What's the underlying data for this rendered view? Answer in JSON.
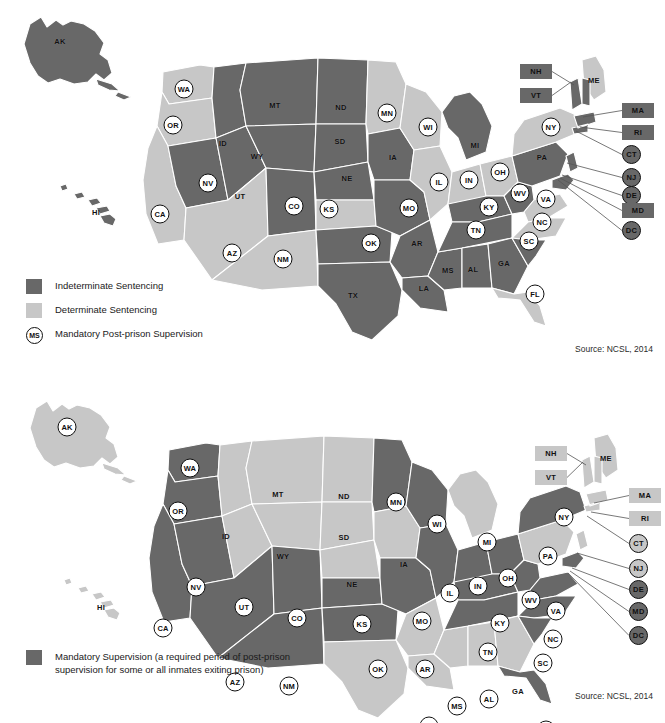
{
  "colors": {
    "dark": "#686868",
    "light": "#c7c7c7",
    "outline": "#ffffff",
    "text": "#101010",
    "background": "#ffffff"
  },
  "maps": [
    {
      "id": "sentencing-map",
      "title": "State Sentencing Structures",
      "source": "Source: NCSL, 2014",
      "legend": [
        {
          "type": "swatch",
          "shade": "dark",
          "label": "Indeterminate Sentencing"
        },
        {
          "type": "swatch",
          "shade": "light",
          "label": "Determinate Sentencing"
        },
        {
          "type": "circle",
          "glyph": "MS",
          "label": "Mandatory Post-prison Supervision"
        }
      ],
      "states": [
        {
          "abbr": "AK",
          "shade": "dark",
          "circled": false,
          "x": 60,
          "y": 41
        },
        {
          "abbr": "HI",
          "shade": "dark",
          "circled": false,
          "x": 96,
          "y": 212
        },
        {
          "abbr": "WA",
          "shade": "light",
          "circled": true,
          "x": 184,
          "y": 89
        },
        {
          "abbr": "OR",
          "shade": "light",
          "circled": true,
          "x": 173,
          "y": 125
        },
        {
          "abbr": "CA",
          "shade": "light",
          "circled": true,
          "x": 160,
          "y": 214
        },
        {
          "abbr": "NV",
          "shade": "dark",
          "circled": true,
          "x": 208,
          "y": 183
        },
        {
          "abbr": "ID",
          "shade": "dark",
          "circled": false,
          "x": 223,
          "y": 143
        },
        {
          "abbr": "UT",
          "shade": "dark",
          "circled": false,
          "x": 240,
          "y": 196
        },
        {
          "abbr": "AZ",
          "shade": "light",
          "circled": true,
          "x": 232,
          "y": 253
        },
        {
          "abbr": "MT",
          "shade": "dark",
          "circled": false,
          "x": 275,
          "y": 105
        },
        {
          "abbr": "WY",
          "shade": "dark",
          "circled": false,
          "x": 257,
          "y": 156
        },
        {
          "abbr": "CO",
          "shade": "dark",
          "circled": true,
          "x": 294,
          "y": 206
        },
        {
          "abbr": "NM",
          "shade": "light",
          "circled": true,
          "x": 283,
          "y": 259
        },
        {
          "abbr": "ND",
          "shade": "dark",
          "circled": false,
          "x": 341,
          "y": 107
        },
        {
          "abbr": "SD",
          "shade": "dark",
          "circled": false,
          "x": 340,
          "y": 141
        },
        {
          "abbr": "NE",
          "shade": "dark",
          "circled": false,
          "x": 347,
          "y": 178
        },
        {
          "abbr": "KS",
          "shade": "light",
          "circled": true,
          "x": 329,
          "y": 209
        },
        {
          "abbr": "OK",
          "shade": "dark",
          "circled": true,
          "x": 371,
          "y": 243
        },
        {
          "abbr": "TX",
          "shade": "dark",
          "circled": false,
          "x": 353,
          "y": 295
        },
        {
          "abbr": "MN",
          "shade": "light",
          "circled": true,
          "x": 387,
          "y": 113
        },
        {
          "abbr": "IA",
          "shade": "dark",
          "circled": false,
          "x": 393,
          "y": 157
        },
        {
          "abbr": "MO",
          "shade": "dark",
          "circled": true,
          "x": 409,
          "y": 208
        },
        {
          "abbr": "AR",
          "shade": "dark",
          "circled": false,
          "x": 417,
          "y": 243
        },
        {
          "abbr": "LA",
          "shade": "dark",
          "circled": false,
          "x": 424,
          "y": 288
        },
        {
          "abbr": "WI",
          "shade": "light",
          "circled": true,
          "x": 428,
          "y": 127
        },
        {
          "abbr": "IL",
          "shade": "light",
          "circled": true,
          "x": 439,
          "y": 182
        },
        {
          "abbr": "IN",
          "shade": "light",
          "circled": true,
          "x": 469,
          "y": 180
        },
        {
          "abbr": "MS",
          "shade": "dark",
          "circled": false,
          "x": 448,
          "y": 270
        },
        {
          "abbr": "MI",
          "shade": "dark",
          "circled": false,
          "x": 475,
          "y": 145
        },
        {
          "abbr": "OH",
          "shade": "light",
          "circled": true,
          "x": 500,
          "y": 172
        },
        {
          "abbr": "KY",
          "shade": "dark",
          "circled": true,
          "x": 489,
          "y": 207
        },
        {
          "abbr": "TN",
          "shade": "dark",
          "circled": true,
          "x": 476,
          "y": 230
        },
        {
          "abbr": "AL",
          "shade": "dark",
          "circled": false,
          "x": 473,
          "y": 269
        },
        {
          "abbr": "GA",
          "shade": "dark",
          "circled": false,
          "x": 504,
          "y": 263
        },
        {
          "abbr": "WV",
          "shade": "dark",
          "circled": true,
          "x": 520,
          "y": 193
        },
        {
          "abbr": "PA",
          "shade": "dark",
          "circled": false,
          "x": 542,
          "y": 157
        },
        {
          "abbr": "NY",
          "shade": "light",
          "circled": true,
          "x": 551,
          "y": 127
        },
        {
          "abbr": "ME",
          "shade": "light",
          "circled": false,
          "x": 594,
          "y": 80
        },
        {
          "abbr": "VA",
          "shade": "light",
          "circled": true,
          "x": 546,
          "y": 199
        },
        {
          "abbr": "NC",
          "shade": "light",
          "circled": true,
          "x": 542,
          "y": 222
        },
        {
          "abbr": "SC",
          "shade": "dark",
          "circled": true,
          "x": 529,
          "y": 241
        },
        {
          "abbr": "FL",
          "shade": "light",
          "circled": true,
          "x": 535,
          "y": 294
        }
      ],
      "callouts": [
        {
          "abbr": "NH",
          "kind": "box",
          "shade": "dark",
          "x": 520,
          "y": 64,
          "tx": 574,
          "ty": 85
        },
        {
          "abbr": "VT",
          "kind": "box",
          "shade": "dark",
          "x": 520,
          "y": 88,
          "tx": 571,
          "ty": 82
        },
        {
          "abbr": "MA",
          "kind": "box",
          "shade": "dark",
          "x": 622,
          "y": 103,
          "tx": 583,
          "ty": 117
        },
        {
          "abbr": "RI",
          "kind": "box",
          "shade": "dark",
          "x": 622,
          "y": 125,
          "tx": 580,
          "ty": 127
        },
        {
          "abbr": "CT",
          "kind": "circle",
          "shade": "dark",
          "x": 622,
          "y": 145,
          "tx": 576,
          "ty": 131
        },
        {
          "abbr": "NJ",
          "kind": "circle",
          "shade": "dark",
          "x": 622,
          "y": 168,
          "tx": 567,
          "ty": 163
        },
        {
          "abbr": "DE",
          "kind": "circle",
          "shade": "dark",
          "x": 622,
          "y": 186,
          "tx": 562,
          "ty": 175
        },
        {
          "abbr": "MD",
          "kind": "box",
          "shade": "dark",
          "x": 622,
          "y": 203,
          "tx": 560,
          "ty": 178
        },
        {
          "abbr": "DC",
          "kind": "circle",
          "shade": "dark",
          "x": 622,
          "y": 221,
          "tx": 558,
          "ty": 180
        }
      ]
    },
    {
      "id": "mandatory-supervision-map",
      "title": "Mandatory Post-prison Supervision",
      "source": "Source: NCSL, 2014",
      "legend": [
        {
          "type": "swatch",
          "shade": "dark",
          "label": "Mandatory Supervision (a required period of post-prison supervision for some or all inmates exiting prison)"
        }
      ],
      "states": [
        {
          "abbr": "AK",
          "shade": "light",
          "circled": true,
          "x": 67,
          "y": 65
        },
        {
          "abbr": "HI",
          "shade": "light",
          "circled": false,
          "x": 101,
          "y": 245
        },
        {
          "abbr": "WA",
          "shade": "dark",
          "circled": true,
          "x": 190,
          "y": 106
        },
        {
          "abbr": "OR",
          "shade": "dark",
          "circled": true,
          "x": 178,
          "y": 149
        },
        {
          "abbr": "CA",
          "shade": "dark",
          "circled": true,
          "x": 163,
          "y": 266
        },
        {
          "abbr": "NV",
          "shade": "dark",
          "circled": true,
          "x": 196,
          "y": 225
        },
        {
          "abbr": "ID",
          "shade": "light",
          "circled": false,
          "x": 226,
          "y": 174
        },
        {
          "abbr": "UT",
          "shade": "light",
          "circled": true,
          "x": 244,
          "y": 245
        },
        {
          "abbr": "AZ",
          "shade": "dark",
          "circled": true,
          "x": 235,
          "y": 320
        },
        {
          "abbr": "MT",
          "shade": "light",
          "circled": false,
          "x": 278,
          "y": 132
        },
        {
          "abbr": "WY",
          "shade": "light",
          "circled": false,
          "x": 283,
          "y": 194
        },
        {
          "abbr": "CO",
          "shade": "dark",
          "circled": true,
          "x": 297,
          "y": 256
        },
        {
          "abbr": "NM",
          "shade": "dark",
          "circled": true,
          "x": 289,
          "y": 324
        },
        {
          "abbr": "ND",
          "shade": "light",
          "circled": false,
          "x": 344,
          "y": 134
        },
        {
          "abbr": "SD",
          "shade": "light",
          "circled": false,
          "x": 344,
          "y": 175
        },
        {
          "abbr": "NE",
          "shade": "light",
          "circled": false,
          "x": 352,
          "y": 222
        },
        {
          "abbr": "KS",
          "shade": "dark",
          "circled": true,
          "x": 362,
          "y": 262
        },
        {
          "abbr": "OK",
          "shade": "dark",
          "circled": true,
          "x": 378,
          "y": 307
        },
        {
          "abbr": "TX",
          "shade": "light",
          "circled": false,
          "x": 361,
          "y": 368
        },
        {
          "abbr": "MN",
          "shade": "dark",
          "circled": true,
          "x": 396,
          "y": 140
        },
        {
          "abbr": "IA",
          "shade": "light",
          "circled": false,
          "x": 404,
          "y": 202
        },
        {
          "abbr": "MO",
          "shade": "dark",
          "circled": true,
          "x": 422,
          "y": 259
        },
        {
          "abbr": "AR",
          "shade": "light",
          "circled": true,
          "x": 425,
          "y": 307
        },
        {
          "abbr": "LA",
          "shade": "light",
          "circled": true,
          "x": 429,
          "y": 364
        },
        {
          "abbr": "WI",
          "shade": "dark",
          "circled": true,
          "x": 437,
          "y": 162
        },
        {
          "abbr": "IL",
          "shade": "dark",
          "circled": true,
          "x": 450,
          "y": 231
        },
        {
          "abbr": "IN",
          "shade": "dark",
          "circled": true,
          "x": 478,
          "y": 224
        },
        {
          "abbr": "MS",
          "shade": "light",
          "circled": true,
          "x": 457,
          "y": 344
        },
        {
          "abbr": "MI",
          "shade": "light",
          "circled": true,
          "x": 487,
          "y": 180
        },
        {
          "abbr": "OH",
          "shade": "dark",
          "circled": true,
          "x": 508,
          "y": 216
        },
        {
          "abbr": "KY",
          "shade": "dark",
          "circled": true,
          "x": 500,
          "y": 261
        },
        {
          "abbr": "TN",
          "shade": "dark",
          "circled": true,
          "x": 488,
          "y": 290
        },
        {
          "abbr": "AL",
          "shade": "light",
          "circled": true,
          "x": 489,
          "y": 337
        },
        {
          "abbr": "GA",
          "shade": "light",
          "circled": false,
          "x": 518,
          "y": 329
        },
        {
          "abbr": "WV",
          "shade": "dark",
          "circled": true,
          "x": 531,
          "y": 238
        },
        {
          "abbr": "PA",
          "shade": "light",
          "circled": true,
          "x": 548,
          "y": 194
        },
        {
          "abbr": "NY",
          "shade": "dark",
          "circled": true,
          "x": 564,
          "y": 155
        },
        {
          "abbr": "ME",
          "shade": "light",
          "circled": false,
          "x": 606,
          "y": 96
        },
        {
          "abbr": "VA",
          "shade": "dark",
          "circled": true,
          "x": 556,
          "y": 249
        },
        {
          "abbr": "NC",
          "shade": "dark",
          "circled": true,
          "x": 553,
          "y": 277
        },
        {
          "abbr": "SC",
          "shade": "dark",
          "circled": true,
          "x": 543,
          "y": 301
        },
        {
          "abbr": "FL",
          "shade": "dark",
          "circled": true,
          "x": 546,
          "y": 368
        }
      ],
      "callouts": [
        {
          "abbr": "NH",
          "kind": "box",
          "shade": "light",
          "x": 535,
          "y": 84,
          "tx": 586,
          "ty": 103
        },
        {
          "abbr": "VT",
          "kind": "box",
          "shade": "light",
          "x": 535,
          "y": 108,
          "tx": 583,
          "ty": 100
        },
        {
          "abbr": "MA",
          "kind": "box",
          "shade": "light",
          "x": 629,
          "y": 126,
          "tx": 594,
          "ty": 141
        },
        {
          "abbr": "RI",
          "kind": "box",
          "shade": "light",
          "x": 629,
          "y": 149,
          "tx": 591,
          "ty": 150
        },
        {
          "abbr": "CT",
          "kind": "circle",
          "shade": "light",
          "x": 629,
          "y": 172,
          "tx": 587,
          "ty": 154
        },
        {
          "abbr": "NJ",
          "kind": "circle",
          "shade": "light",
          "x": 629,
          "y": 197,
          "tx": 577,
          "ty": 191
        },
        {
          "abbr": "DE",
          "kind": "circle",
          "shade": "dark",
          "x": 629,
          "y": 218,
          "tx": 572,
          "ty": 206
        },
        {
          "abbr": "MD",
          "kind": "circle",
          "shade": "dark",
          "x": 629,
          "y": 240,
          "tx": 570,
          "ty": 209
        },
        {
          "abbr": "DC",
          "kind": "circle",
          "shade": "dark",
          "x": 629,
          "y": 264,
          "tx": 568,
          "ty": 211
        }
      ]
    }
  ]
}
